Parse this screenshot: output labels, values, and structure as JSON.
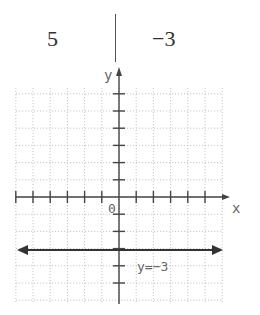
{
  "table": {
    "x_value": "5",
    "y_value": "−3"
  },
  "graph": {
    "x_axis_label": "x",
    "y_axis_label": "y",
    "origin_label": "0",
    "line_label": "y=−3",
    "line_equation": "y = -3"
  },
  "chart_data": {
    "type": "line",
    "title": "",
    "xlabel": "x",
    "ylabel": "y",
    "xlim": [
      -6,
      6
    ],
    "ylim": [
      -6,
      6
    ],
    "grid": true,
    "series": [
      {
        "name": "y=-3",
        "x": [
          -6,
          6
        ],
        "y": [
          -3,
          -3
        ],
        "arrows": "both"
      }
    ],
    "table_point": {
      "x": 5,
      "y": -3
    }
  }
}
